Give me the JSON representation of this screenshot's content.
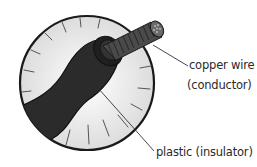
{
  "diagram": {
    "title": "",
    "labels": {
      "conductor_line1": "copper wire",
      "conductor_line2": "(conductor)",
      "insulator": "plastic (insulator)"
    },
    "parts": [
      {
        "name": "copper wire",
        "role": "conductor"
      },
      {
        "name": "plastic",
        "role": "insulator"
      }
    ],
    "colors": {
      "background": "#ffffff",
      "circle_fill": "#e6e6e6",
      "circle_stroke": "#1a1a1a",
      "insulator": "#2b2b2b",
      "conductor": "#4a4a4a",
      "leader_line": "#333333"
    }
  }
}
